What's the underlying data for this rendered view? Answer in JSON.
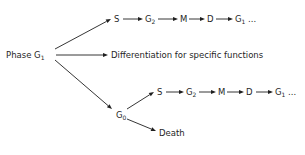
{
  "diagram": {
    "root": {
      "label": "Phase G",
      "sub": "1"
    },
    "top_chain": [
      {
        "label": "S",
        "sub": ""
      },
      {
        "label": "G",
        "sub": "2"
      },
      {
        "label": "M",
        "sub": ""
      },
      {
        "label": "D",
        "sub": ""
      },
      {
        "label": "G",
        "sub": "1",
        "suffix": " ..."
      }
    ],
    "middle": {
      "label": "Differentiation for specific functions"
    },
    "g0": {
      "label": "G",
      "sub": "0"
    },
    "g0_chain": [
      {
        "label": "S",
        "sub": ""
      },
      {
        "label": "G",
        "sub": "2"
      },
      {
        "label": "M",
        "sub": ""
      },
      {
        "label": "D",
        "sub": ""
      },
      {
        "label": "G",
        "sub": "1",
        "suffix": " ..."
      }
    ],
    "death": {
      "label": "Death"
    },
    "colors": {
      "ink": "#1f1f1f",
      "background": "#ffffff"
    }
  }
}
